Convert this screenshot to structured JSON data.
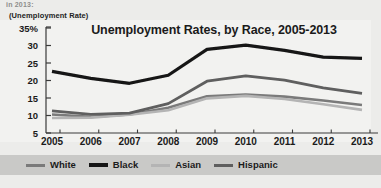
{
  "top_strip_text": "in 2013:",
  "axis_caption": "(Unemployment Rate)",
  "colors": {
    "white_series": "#7a7a7a",
    "black_series": "#151515",
    "asian_series": "#b4b4b4",
    "hispanic_series": "#5e5e5e",
    "panel_background": "#f2f2f0",
    "figure_background": "#ececea",
    "legend_band": "#c9c9c7",
    "axis_line": "#3a3a3a",
    "text": "#1b1b1b"
  },
  "chart_data": {
    "type": "line",
    "title": "Unemployment Rates, by Race, 2005-2013",
    "xlabel": "",
    "ylabel": "(Unemployment Rate)",
    "ylim": [
      5,
      35
    ],
    "yticks": [
      "35%",
      "30",
      "25",
      "20",
      "15",
      "10",
      "5"
    ],
    "ytick_values": [
      35,
      30,
      25,
      20,
      15,
      10,
      5
    ],
    "grid": false,
    "legend_position": "bottom",
    "categories": [
      "2005",
      "2006",
      "2007",
      "2008",
      "2009",
      "2010",
      "2011",
      "2012",
      "2013"
    ],
    "x": [
      2005,
      2006,
      2007,
      2008,
      2009,
      2010,
      2011,
      2012,
      2013
    ],
    "series": [
      {
        "name": "White",
        "color": "#7a7a7a",
        "width": 2.6,
        "values": [
          10.3,
          9.6,
          10.3,
          12.2,
          15.5,
          16.0,
          15.4,
          14.3,
          13.0
        ]
      },
      {
        "name": "Black",
        "color": "#151515",
        "width": 3.2,
        "values": [
          22.6,
          20.6,
          19.2,
          21.5,
          28.9,
          30.1,
          28.6,
          26.7,
          26.3
        ]
      },
      {
        "name": "Asian",
        "color": "#b4b4b4",
        "width": 2.6,
        "values": [
          9.3,
          9.4,
          10.2,
          11.5,
          14.9,
          15.6,
          14.7,
          13.2,
          11.6
        ]
      },
      {
        "name": "Hispanic",
        "color": "#5e5e5e",
        "width": 2.8,
        "values": [
          11.3,
          10.3,
          10.7,
          13.4,
          19.8,
          21.3,
          20.1,
          17.9,
          16.3
        ]
      }
    ]
  },
  "legend": {
    "items": [
      {
        "label": "White",
        "swatch_color": "#7a7a7a"
      },
      {
        "label": "Black",
        "swatch_color": "#151515"
      },
      {
        "label": "Asian",
        "swatch_color": "#b4b4b4"
      },
      {
        "label": "Hispanic",
        "swatch_color": "#5e5e5e"
      }
    ]
  }
}
